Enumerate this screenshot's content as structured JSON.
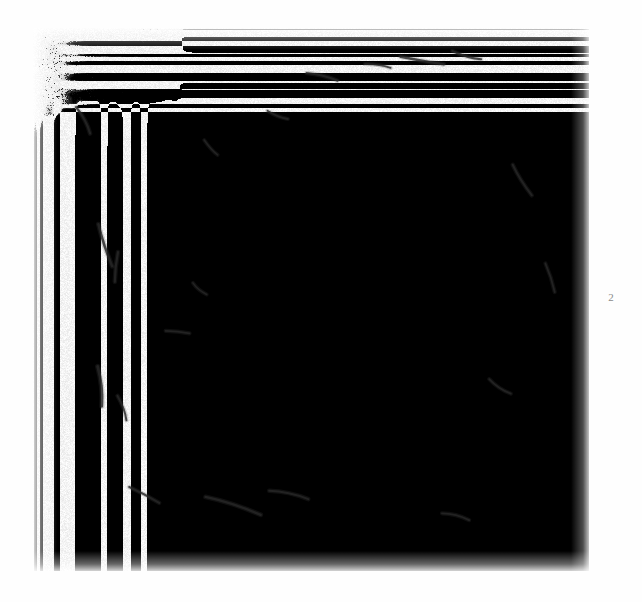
{
  "page": {
    "width": 642,
    "height": 602,
    "background_color": "#ffffff",
    "kind": "scanned-document-page"
  },
  "figure": {
    "caption_number": "2",
    "alt_description": "Grainy black-and-white photomicrograph plate with mottled halftone texture",
    "bounds": {
      "x": 33,
      "y": 28,
      "width": 556,
      "height": 543
    },
    "media": "halftone-photomicrograph"
  },
  "plate": {
    "base_color": "#ffffff",
    "grain_color": "#2b2b2b",
    "mid_tone_color": "#9a9a9a",
    "dark_tone_color": "#4a4a4a",
    "grain_density": 0.52,
    "tone_field": {
      "description": "Relative darkness 0 (paper white) to 1 (darkest) sampled on a coarse grid across the plate",
      "cols": 9,
      "rows": 9,
      "values": [
        [
          0.3,
          0.26,
          0.2,
          0.18,
          0.22,
          0.3,
          0.42,
          0.58,
          0.66
        ],
        [
          0.24,
          0.18,
          0.14,
          0.14,
          0.18,
          0.26,
          0.38,
          0.5,
          0.56
        ],
        [
          0.26,
          0.16,
          0.12,
          0.12,
          0.16,
          0.26,
          0.38,
          0.48,
          0.54
        ],
        [
          0.28,
          0.16,
          0.12,
          0.13,
          0.2,
          0.3,
          0.4,
          0.48,
          0.52
        ],
        [
          0.3,
          0.18,
          0.13,
          0.16,
          0.24,
          0.34,
          0.42,
          0.5,
          0.54
        ],
        [
          0.34,
          0.22,
          0.16,
          0.2,
          0.28,
          0.38,
          0.46,
          0.54,
          0.58
        ],
        [
          0.48,
          0.32,
          0.22,
          0.24,
          0.3,
          0.4,
          0.48,
          0.58,
          0.64
        ],
        [
          0.56,
          0.4,
          0.26,
          0.24,
          0.28,
          0.38,
          0.48,
          0.58,
          0.62
        ],
        [
          0.5,
          0.38,
          0.24,
          0.18,
          0.22,
          0.32,
          0.44,
          0.54,
          0.56
        ]
      ]
    },
    "dark_streaks": [
      {
        "x": 0.13,
        "y": 0.4,
        "length": 44,
        "angle": 72,
        "width": 2.6
      },
      {
        "x": 0.15,
        "y": 0.44,
        "length": 30,
        "angle": 96,
        "width": 2.2
      },
      {
        "x": 0.12,
        "y": 0.66,
        "length": 40,
        "angle": 84,
        "width": 2.8
      },
      {
        "x": 0.16,
        "y": 0.7,
        "length": 26,
        "angle": 70,
        "width": 2.0
      },
      {
        "x": 0.09,
        "y": 0.17,
        "length": 30,
        "angle": 62,
        "width": 2.2
      },
      {
        "x": 0.2,
        "y": 0.86,
        "length": 34,
        "angle": 28,
        "width": 2.0
      },
      {
        "x": 0.36,
        "y": 0.88,
        "length": 58,
        "angle": 18,
        "width": 2.4
      },
      {
        "x": 0.46,
        "y": 0.86,
        "length": 40,
        "angle": 12,
        "width": 2.0
      },
      {
        "x": 0.52,
        "y": 0.09,
        "length": 32,
        "angle": 14,
        "width": 2.0
      },
      {
        "x": 0.62,
        "y": 0.07,
        "length": 26,
        "angle": 8,
        "width": 1.8
      },
      {
        "x": 0.7,
        "y": 0.06,
        "length": 44,
        "angle": 10,
        "width": 2.4
      },
      {
        "x": 0.78,
        "y": 0.05,
        "length": 30,
        "angle": 16,
        "width": 2.0
      },
      {
        "x": 0.44,
        "y": 0.16,
        "length": 22,
        "angle": 22,
        "width": 1.8
      },
      {
        "x": 0.32,
        "y": 0.22,
        "length": 20,
        "angle": 48,
        "width": 1.6
      },
      {
        "x": 0.88,
        "y": 0.28,
        "length": 36,
        "angle": 58,
        "width": 2.0
      },
      {
        "x": 0.93,
        "y": 0.46,
        "length": 30,
        "angle": 72,
        "width": 1.8
      },
      {
        "x": 0.84,
        "y": 0.66,
        "length": 26,
        "angle": 34,
        "width": 1.8
      },
      {
        "x": 0.26,
        "y": 0.56,
        "length": 24,
        "angle": 6,
        "width": 1.8
      },
      {
        "x": 0.3,
        "y": 0.48,
        "length": 18,
        "angle": 40,
        "width": 1.6
      },
      {
        "x": 0.76,
        "y": 0.9,
        "length": 28,
        "angle": 14,
        "width": 1.8
      }
    ]
  }
}
